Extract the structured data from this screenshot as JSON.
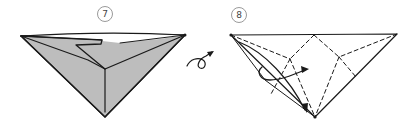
{
  "diagram": {
    "steps": [
      {
        "number": "7",
        "description": "Folded model, colored side showing"
      },
      {
        "number": "8",
        "description": "Turned over model with dashed fold lines and folding arrow"
      }
    ],
    "symbols": {
      "turn_over": "turn-over-arrow"
    },
    "colors": {
      "paper_shaded": "#bdbdbd",
      "paper_white": "#ffffff",
      "line": "#1a1a1a",
      "label_circle": "#9a9a9a"
    }
  }
}
